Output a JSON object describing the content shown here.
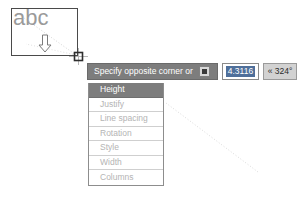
{
  "canvas": {
    "textbox": {
      "sample_text": "abc",
      "cursor_icon": "crosshair-pickbox-icon",
      "arrow_icon": "down-arrow-icon"
    }
  },
  "dynamic_input": {
    "prompt": "Specify opposite corner or",
    "options_toggle_icon": "options-square-icon",
    "fields": [
      {
        "name": "distance",
        "value": "4.3116",
        "selected": true
      },
      {
        "name": "angle",
        "value": "« 324°",
        "selected": false
      }
    ]
  },
  "option_menu": {
    "items": [
      {
        "label": "Height",
        "highlighted": true
      },
      {
        "label": "Justify",
        "highlighted": false
      },
      {
        "label": "Line spacing",
        "highlighted": false
      },
      {
        "label": "Rotation",
        "highlighted": false
      },
      {
        "label": "Style",
        "highlighted": false
      },
      {
        "label": "Width",
        "highlighted": false
      },
      {
        "label": "Columns",
        "highlighted": false
      }
    ]
  },
  "colors": {
    "prompt_bar": "#7d7d7d",
    "highlight_row": "#7d7d7d",
    "selection_blue": "#4f6f9a",
    "menu_text": "#b4b4b4",
    "outline": "#4a4a4a"
  }
}
